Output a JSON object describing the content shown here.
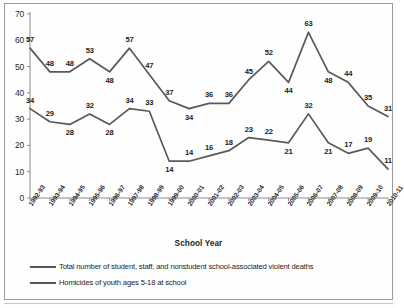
{
  "chart_data": {
    "type": "line",
    "title": "",
    "xlabel": "School Year",
    "ylabel": "",
    "ylim": [
      0,
      70
    ],
    "ytick_step": 10,
    "grid": false,
    "legend_position": "bottom-left",
    "categories": [
      "1992-93",
      "1993-94",
      "1994-95",
      "1995-96",
      "1996-97",
      "1997-98",
      "1998-99",
      "1999-00",
      "2000-01",
      "2001-02",
      "2002-03",
      "2003-04",
      "2004-05",
      "2005-06",
      "2006-07",
      "2007-08",
      "2008-09",
      "2009-10",
      "2010-11"
    ],
    "yticks": [
      "0",
      "10",
      "20",
      "30",
      "40",
      "50",
      "60",
      "70"
    ],
    "series": [
      {
        "name": "Total number of student, staff, and nonstudent school-associated violent deaths",
        "color": "#595959",
        "values": [
          57,
          48,
          48,
          53,
          48,
          57,
          47,
          37,
          34,
          36,
          36,
          45,
          52,
          44,
          63,
          48,
          44,
          35,
          31
        ],
        "label_positions": [
          "above",
          "above",
          "above",
          "above",
          "below",
          "above",
          "above",
          "above",
          "below",
          "above",
          "above",
          "above",
          "above",
          "below",
          "above",
          "below",
          "above",
          "above",
          "above"
        ]
      },
      {
        "name": "Homicides of youth ages 5-18 at school",
        "color": "#595959",
        "values": [
          34,
          29,
          28,
          32,
          28,
          34,
          33,
          14,
          14,
          16,
          18,
          23,
          22,
          21,
          32,
          21,
          17,
          19,
          11
        ],
        "label_positions": [
          "above",
          "above",
          "below",
          "above",
          "below",
          "above",
          "above",
          "below",
          "above",
          "above",
          "above",
          "above",
          "above",
          "below",
          "above",
          "below",
          "above",
          "above",
          "above"
        ]
      }
    ]
  },
  "axis": {
    "x_title": "School Year"
  },
  "legend": {
    "entries": [
      "Total number of student, staff, and nonstudent school-associated violent deaths",
      "Homicides of youth ages 5-18 at school"
    ]
  }
}
